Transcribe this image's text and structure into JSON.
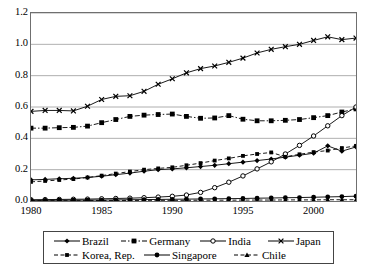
{
  "chart_data": {
    "type": "line",
    "title": "",
    "xlabel": "",
    "ylabel": "",
    "xlim": [
      1980,
      2003
    ],
    "ylim": [
      0.0,
      1.2
    ],
    "ytick_step": 0.2,
    "grid": true,
    "legend_position": "bottom",
    "x": [
      1980,
      1981,
      1982,
      1983,
      1984,
      1985,
      1986,
      1987,
      1988,
      1989,
      1990,
      1991,
      1992,
      1993,
      1994,
      1995,
      1996,
      1997,
      1998,
      1999,
      2000,
      2001,
      2002,
      2003
    ],
    "xticklabels": [
      "1980",
      "1985",
      "1990",
      "1995",
      "2000"
    ],
    "xtick_values": [
      1980,
      1985,
      1990,
      1995,
      2000
    ],
    "yticklabels": [
      "0.0",
      "0.2",
      "0.4",
      "0.6",
      "0.8",
      "1.0",
      "1.2"
    ],
    "ytick_values": [
      0.0,
      0.2,
      0.4,
      0.6,
      0.8,
      1.0,
      1.2
    ],
    "series": [
      {
        "name": "Brazil",
        "marker": "diamond",
        "dash": "solid",
        "values": [
          0.135,
          0.138,
          0.142,
          0.145,
          0.15,
          0.158,
          0.168,
          0.178,
          0.19,
          0.2,
          0.205,
          0.212,
          0.22,
          0.228,
          0.238,
          0.248,
          0.258,
          0.268,
          0.28,
          0.292,
          0.305,
          0.352,
          0.318,
          0.345
        ]
      },
      {
        "name": "Germany",
        "marker": "square-filled",
        "dash": "dashdot",
        "values": [
          0.465,
          0.465,
          0.468,
          0.47,
          0.478,
          0.5,
          0.52,
          0.54,
          0.548,
          0.552,
          0.555,
          0.54,
          0.528,
          0.53,
          0.545,
          0.522,
          0.512,
          0.512,
          0.515,
          0.52,
          0.532,
          0.545,
          0.568,
          0.588
        ]
      },
      {
        "name": "India",
        "marker": "circle-open",
        "dash": "solid",
        "values": [
          0.008,
          0.009,
          0.01,
          0.011,
          0.012,
          0.014,
          0.016,
          0.018,
          0.021,
          0.025,
          0.03,
          0.038,
          0.055,
          0.085,
          0.12,
          0.16,
          0.205,
          0.25,
          0.3,
          0.355,
          0.415,
          0.48,
          0.545,
          0.6
        ]
      },
      {
        "name": "Japan",
        "marker": "x",
        "dash": "solid",
        "values": [
          0.572,
          0.578,
          0.578,
          0.575,
          0.605,
          0.648,
          0.668,
          0.672,
          0.7,
          0.745,
          0.78,
          0.818,
          0.845,
          0.862,
          0.885,
          0.912,
          0.945,
          0.968,
          0.985,
          1.0,
          1.025,
          1.048,
          1.03,
          1.04
        ]
      },
      {
        "name": "Korea, Rep.",
        "marker": "square-small",
        "dash": "dashed",
        "values": [
          0.122,
          0.128,
          0.134,
          0.14,
          0.15,
          0.162,
          0.175,
          0.188,
          0.2,
          0.208,
          0.215,
          0.228,
          0.242,
          0.258,
          0.272,
          0.288,
          0.3,
          0.31,
          0.282,
          0.298,
          0.312,
          0.322,
          0.338,
          0.352
        ]
      },
      {
        "name": "Singapore",
        "marker": "circle-filled",
        "dash": "solid",
        "values": [
          0.004,
          0.004,
          0.005,
          0.005,
          0.006,
          0.006,
          0.007,
          0.008,
          0.009,
          0.01,
          0.011,
          0.012,
          0.013,
          0.014,
          0.015,
          0.016,
          0.018,
          0.019,
          0.021,
          0.022,
          0.024,
          0.026,
          0.028,
          0.031
        ]
      },
      {
        "name": "Chile",
        "marker": "triangle",
        "dash": "dashed",
        "values": [
          0.002,
          0.002,
          0.002,
          0.002,
          0.003,
          0.003,
          0.003,
          0.003,
          0.004,
          0.004,
          0.004,
          0.004,
          0.005,
          0.005,
          0.005,
          0.006,
          0.006,
          0.006,
          0.007,
          0.007,
          0.007,
          0.008,
          0.008,
          0.008
        ]
      }
    ]
  },
  "legend": {
    "rows": [
      [
        "Brazil",
        "Germany",
        "India",
        "Japan"
      ],
      [
        "Korea, Rep.",
        "Singapore",
        "Chile"
      ]
    ]
  }
}
